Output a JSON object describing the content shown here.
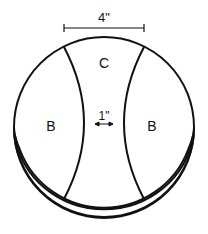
{
  "diagram": {
    "type": "cylinder-top-view-with-arc-regions",
    "dimensions": {
      "width_label": "4\"",
      "gap_label": "1\""
    },
    "regions": {
      "left": "B",
      "right": "B",
      "top": "C"
    },
    "colors": {
      "stroke": "#111111",
      "background": "#ffffff"
    }
  }
}
